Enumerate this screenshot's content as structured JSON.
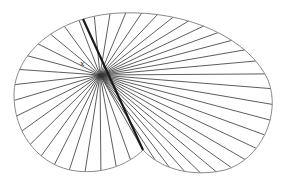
{
  "diagram": {
    "type": "radial-chords-in-curve",
    "center_label": "x",
    "center": [
      100,
      75
    ],
    "outline_color": "#8a8a8a",
    "line_color": "#333333",
    "thick_line_color": "#1a1a1a",
    "cusp": [
      143,
      150
    ],
    "thick_line": {
      "from": [
        83,
        19
      ],
      "to": [
        143,
        150
      ]
    }
  }
}
